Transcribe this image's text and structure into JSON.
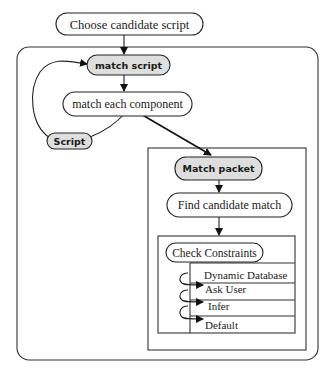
{
  "diagram": {
    "nodes": {
      "choose_candidate_script": "Choose candidate script",
      "match_script": "match script",
      "match_each_component": "match each component",
      "script": "Script",
      "match_packet": "Match packet",
      "find_candidate_match": "Find candidate match",
      "check_constraints": "Check Constraints"
    },
    "constraint_sources": [
      {
        "label": "Dynamic Database"
      },
      {
        "label": "Ask User"
      },
      {
        "label": "Infer"
      },
      {
        "label": "Default"
      }
    ],
    "edges": [
      {
        "from": "choose_candidate_script",
        "to": "match_script"
      },
      {
        "from": "match_script",
        "to": "match_each_component"
      },
      {
        "from": "match_each_component",
        "to": "script"
      },
      {
        "from": "script",
        "to": "match_script"
      },
      {
        "from": "match_each_component",
        "to": "match_packet"
      },
      {
        "from": "match_packet",
        "to": "find_candidate_match"
      },
      {
        "from": "find_candidate_match",
        "to": "check_constraints"
      },
      {
        "from": "dynamic_database",
        "to": "ask_user"
      },
      {
        "from": "ask_user",
        "to": "infer"
      },
      {
        "from": "infer",
        "to": "default"
      }
    ],
    "colors": {
      "highlight_fill": "#dedede",
      "stroke": "#222222",
      "background": "#ffffff"
    }
  }
}
